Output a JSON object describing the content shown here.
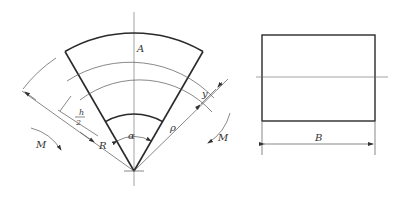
{
  "figure": {
    "left_view": {
      "title": "curved beam sector",
      "apex": [
        134,
        171
      ],
      "half_angle_deg": 30,
      "radii": {
        "outer": 138,
        "section_A": 116,
        "neutral": 98,
        "inner": 57
      },
      "labels": {
        "A": "A",
        "alpha": "α",
        "rho": "ρ",
        "R": "R",
        "y": "y",
        "h_half_num": "h",
        "h_half_den": "2",
        "M_left": "M",
        "M_right": "M"
      }
    },
    "right_view": {
      "title": "cross-section rectangle",
      "rect": {
        "x": 262,
        "y": 35,
        "w": 113,
        "h": 86
      },
      "labels": {
        "B": "B"
      }
    }
  }
}
